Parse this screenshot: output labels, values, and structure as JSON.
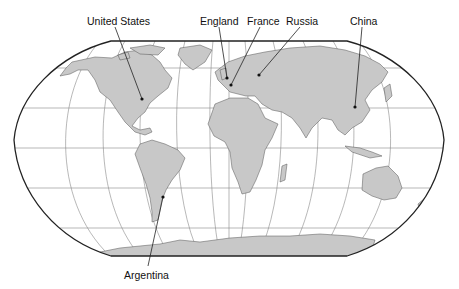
{
  "map": {
    "projection": "robinson",
    "land_color": "#c8c8c8",
    "ocean_color": "#ffffff",
    "border_color": "#222222",
    "graticule_color": "#777777",
    "labels": [
      {
        "id": "united-states",
        "text": "United States",
        "x": 87,
        "y": 15,
        "anchor_x": 142,
        "anchor_y": 99,
        "line_x": 115,
        "line_y": 27
      },
      {
        "id": "england",
        "text": "England",
        "x": 200,
        "y": 15,
        "anchor_x": 227,
        "anchor_y": 78,
        "line_x": 219,
        "line_y": 27
      },
      {
        "id": "france",
        "text": "France",
        "x": 247,
        "y": 15,
        "anchor_x": 231,
        "anchor_y": 85,
        "line_x": 260,
        "line_y": 27
      },
      {
        "id": "russia",
        "text": "Russia",
        "x": 286,
        "y": 15,
        "anchor_x": 259,
        "anchor_y": 75,
        "line_x": 300,
        "line_y": 27
      },
      {
        "id": "china",
        "text": "China",
        "x": 350,
        "y": 15,
        "anchor_x": 355,
        "anchor_y": 107,
        "line_x": 362,
        "line_y": 27
      },
      {
        "id": "argentina",
        "text": "Argentina",
        "x": 124,
        "y": 269,
        "anchor_x": 163,
        "anchor_y": 197,
        "line_x": 148,
        "line_y": 266
      }
    ]
  }
}
